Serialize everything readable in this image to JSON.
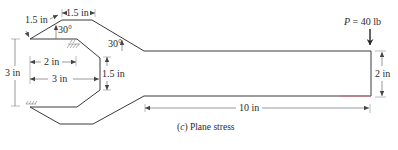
{
  "figure": {
    "caption_prefix": "(",
    "caption_letter": "c",
    "caption_suffix": ") Plane stress",
    "load": {
      "symbol": "P",
      "equals": " = 40 lb",
      "value": 40,
      "unit": "lb"
    },
    "dimensions": {
      "arm_slant_length": "1.5 in",
      "top_flat_length": "1.5 in",
      "upper_angle": "30°",
      "beam_angle": "30°",
      "overall_height": "3 in",
      "inner_width_2": "2 in",
      "inner_width_3": "3 in",
      "throat_height": "1.5 in",
      "beam_depth": "2 in",
      "beam_length": "10 in"
    },
    "supports": [
      "fixed-support-upper",
      "fixed-support-lower"
    ],
    "colors": {
      "outline": "#3a3a3a",
      "dimension": "#555555",
      "accent_red": "#d9607a"
    }
  }
}
